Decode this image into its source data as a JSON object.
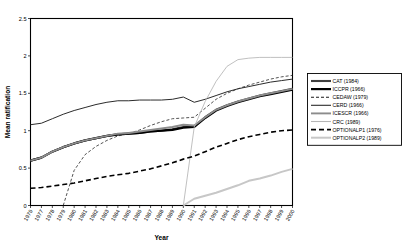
{
  "chart_data": {
    "type": "line",
    "title": "",
    "xlabel": "Year",
    "ylabel": "Mean ratification",
    "xlim": [
      1976,
      2000
    ],
    "ylim": [
      0,
      2.5
    ],
    "yticks": [
      "0",
      "0.5",
      "1",
      "1.5",
      "2",
      "2.5"
    ],
    "ytick_values": [
      0,
      0.5,
      1,
      1.5,
      2,
      2.5
    ],
    "grid": false,
    "legend_position": "right",
    "x": [
      1976,
      1977,
      1978,
      1979,
      1980,
      1981,
      1982,
      1983,
      1984,
      1985,
      1986,
      1987,
      1988,
      1989,
      1990,
      1991,
      1992,
      1993,
      1994,
      1995,
      1996,
      1997,
      1998,
      1999,
      2000
    ],
    "xtick_labels": [
      "1976",
      "1977",
      "1978",
      "1979",
      "1980",
      "1981",
      "1982",
      "1983",
      "1984",
      "1985",
      "1986",
      "1987",
      "1988",
      "1989",
      "1990",
      "1991",
      "1992",
      "1993",
      "1994",
      "1995",
      "1996",
      "1997",
      "1998",
      "1999",
      "2000"
    ],
    "series": [
      {
        "name": "CAT (1984)",
        "label": "CAT (1984)",
        "color": "#3f3f3f",
        "width": 2.1,
        "dash": "none",
        "values": [
          0.6,
          0.64,
          0.72,
          0.78,
          0.83,
          0.87,
          0.9,
          0.93,
          0.95,
          0.96,
          0.97,
          0.99,
          1.0,
          1.02,
          1.05,
          1.06,
          1.18,
          1.28,
          1.34,
          1.39,
          1.43,
          1.47,
          1.5,
          1.53,
          1.56
        ]
      },
      {
        "name": "ICCPR (1966)",
        "label": "ICCPR (1966)",
        "color": "#000000",
        "width": 2.2,
        "dash": "none",
        "values": [
          0.6,
          0.64,
          0.72,
          0.78,
          0.83,
          0.87,
          0.9,
          0.93,
          0.95,
          0.96,
          0.97,
          0.99,
          1.0,
          1.01,
          1.04,
          1.05,
          1.17,
          1.27,
          1.33,
          1.38,
          1.42,
          1.46,
          1.49,
          1.52,
          1.55
        ]
      },
      {
        "name": "CEDAW (1979)",
        "label": "CEDAW (1979)",
        "color": "#1a1a1a",
        "width": 0.75,
        "dash": "3,2",
        "values": [
          0.0,
          0.0,
          0.0,
          0.0,
          0.47,
          0.68,
          0.79,
          0.87,
          0.93,
          0.96,
          1.01,
          1.07,
          1.12,
          1.16,
          1.17,
          1.18,
          1.3,
          1.42,
          1.5,
          1.56,
          1.61,
          1.65,
          1.69,
          1.72,
          1.74
        ]
      },
      {
        "name": "CERD (1966)",
        "label": "CERD (1966)",
        "color": "#2b2b2b",
        "width": 1.0,
        "dash": "none",
        "values": [
          1.08,
          1.1,
          1.16,
          1.22,
          1.27,
          1.31,
          1.35,
          1.38,
          1.4,
          1.4,
          1.41,
          1.41,
          1.41,
          1.42,
          1.45,
          1.38,
          1.42,
          1.47,
          1.52,
          1.56,
          1.59,
          1.62,
          1.65,
          1.67,
          1.69
        ]
      },
      {
        "name": "ICESCR (1966)",
        "label": "ICESCR (1966)",
        "color": "#8c8c8c",
        "width": 1.9,
        "dash": "none",
        "values": [
          0.6,
          0.64,
          0.72,
          0.78,
          0.83,
          0.87,
          0.9,
          0.93,
          0.96,
          0.97,
          0.99,
          1.01,
          1.03,
          1.05,
          1.08,
          1.07,
          1.18,
          1.28,
          1.34,
          1.39,
          1.43,
          1.47,
          1.5,
          1.53,
          1.56
        ]
      },
      {
        "name": "CRC (1989)",
        "label": "CRC (1989)",
        "color": "#b5b5b5",
        "width": 0.85,
        "dash": "none",
        "values": [
          0.0,
          0.0,
          0.0,
          0.0,
          0.0,
          0.0,
          0.0,
          0.0,
          0.0,
          0.0,
          0.0,
          0.0,
          0.0,
          0.0,
          0.0,
          1.05,
          1.39,
          1.66,
          1.86,
          1.95,
          1.97,
          1.98,
          1.98,
          1.98,
          1.98
        ]
      },
      {
        "name": "OPTIONALP1 (1976)",
        "label": "OPTIONALP1 (1976)",
        "color": "#000000",
        "width": 1.6,
        "dash": "5,3",
        "values": [
          0.23,
          0.24,
          0.26,
          0.28,
          0.3,
          0.33,
          0.36,
          0.39,
          0.41,
          0.43,
          0.46,
          0.49,
          0.53,
          0.57,
          0.62,
          0.66,
          0.72,
          0.78,
          0.83,
          0.88,
          0.92,
          0.95,
          0.98,
          1.0,
          1.01
        ]
      },
      {
        "name": "OPTIONALP2 (1989)",
        "label": "OPTIONALP2 (1989)",
        "color": "#c7c7c7",
        "width": 2.0,
        "dash": "none",
        "values": [
          0.0,
          0.0,
          0.0,
          0.0,
          0.0,
          0.0,
          0.0,
          0.0,
          0.0,
          0.0,
          0.0,
          0.0,
          0.0,
          0.0,
          0.0,
          0.09,
          0.13,
          0.17,
          0.22,
          0.27,
          0.33,
          0.36,
          0.4,
          0.45,
          0.49
        ]
      }
    ]
  }
}
